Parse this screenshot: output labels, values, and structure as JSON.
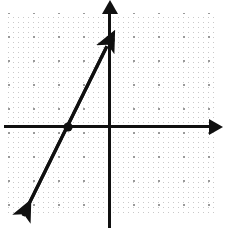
{
  "chart_data": {
    "type": "line",
    "title": "",
    "subtitle": "",
    "xlabel": "",
    "ylabel": "",
    "grid": "dotted-lattice",
    "legend": "none",
    "axes": {
      "origin_px": [
        110,
        127
      ],
      "unit_px": [
        25,
        24
      ],
      "xlim": [
        -4.2,
        4.4
      ],
      "ylim": [
        -4.3,
        4.8
      ],
      "x_axis_arrow": "right",
      "y_axis_arrow": "up",
      "tick_labels_x": [],
      "tick_labels_y": []
    },
    "series": [
      {
        "name": "line",
        "type": "line",
        "slope": 2,
        "intercept": 3.5,
        "equation": "y = 2x + 3.5",
        "x_intercept": -1.7,
        "y_intercept": 3.5,
        "arrow_start": "down-left",
        "arrow_end": "up-right",
        "color": "#101010",
        "points_px": [
          [
            20,
            222
          ],
          [
            68,
            127
          ],
          [
            110,
            40
          ]
        ],
        "markers_px": [
          [
            68,
            127
          ],
          [
            110,
            40
          ]
        ]
      }
    ],
    "annotations": []
  },
  "graph": {
    "canvas_name": "coordinate-plane",
    "background_color": "#ffffff",
    "axis_color": "#101010",
    "grid_minor_color": "#c9c9c9",
    "grid_major_color": "#9a9a9a",
    "line_color": "#101010",
    "marker_color": "#101010",
    "alt_text": "Coordinate plane with dotted grid showing a steeply rising straight line with arrowheads at both ends, crossing the x-axis left of the origin and the y-axis above the origin."
  }
}
